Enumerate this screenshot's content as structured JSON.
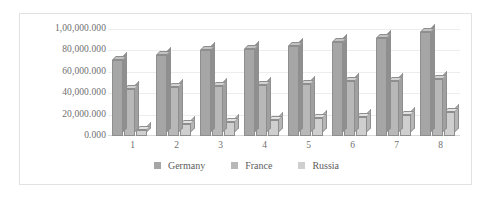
{
  "chart_data": {
    "type": "bar",
    "title": "",
    "xlabel": "",
    "ylabel": "",
    "ylim": [
      0,
      100000
    ],
    "grid": true,
    "legend_position": "bottom",
    "categories": [
      "1",
      "2",
      "3",
      "4",
      "5",
      "6",
      "7",
      "8"
    ],
    "y_ticks": [
      0,
      20000,
      40000,
      60000,
      80000,
      100000
    ],
    "y_tick_labels": [
      "0.000",
      "20,000.000",
      "40,000.000",
      "60,000.000",
      "80,000.000",
      "1,00,000.000"
    ],
    "series": [
      {
        "name": "Germany",
        "color": "#a6a6a6",
        "values": [
          71000,
          76000,
          80000,
          81000,
          84000,
          88000,
          92000,
          97000
        ]
      },
      {
        "name": "France",
        "color": "#b8b8b8",
        "values": [
          44000,
          46000,
          47000,
          48000,
          49000,
          51000,
          51000,
          53000
        ]
      },
      {
        "name": "Russia",
        "color": "#cfcfcf",
        "values": [
          6000,
          11000,
          13000,
          15000,
          17000,
          18000,
          20000,
          22000
        ]
      }
    ]
  },
  "legend": {
    "items": [
      {
        "label": "Germany",
        "color": "#a6a6a6"
      },
      {
        "label": "France",
        "color": "#b8b8b8"
      },
      {
        "label": "Russia",
        "color": "#cfcfcf"
      }
    ]
  }
}
